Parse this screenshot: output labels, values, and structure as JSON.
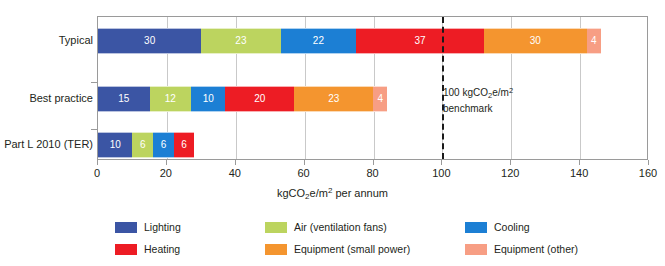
{
  "chart_data": {
    "type": "bar",
    "orientation": "horizontal",
    "stacked": true,
    "title": "",
    "xlabel": "kgCO2e/m2 per annum",
    "ylabel": "",
    "xlim": [
      0,
      160
    ],
    "xticks": [
      0,
      20,
      40,
      60,
      80,
      100,
      120,
      140,
      160
    ],
    "xtick_labels": [
      "0",
      "20",
      "40",
      "60",
      "80",
      "100",
      "120",
      "140",
      "160"
    ],
    "grid": true,
    "legend_position": "bottom",
    "categories": [
      "Typical",
      "Best practice",
      "Part L 2010 (TER)"
    ],
    "series": [
      {
        "name": "Lighting",
        "color": "#3b55a4",
        "values": [
          30,
          15,
          10
        ]
      },
      {
        "name": "Air (ventilation fans)",
        "color": "#bcd45f",
        "values": [
          23,
          12,
          6
        ]
      },
      {
        "name": "Cooling",
        "color": "#1c7fd4",
        "values": [
          22,
          10,
          6
        ]
      },
      {
        "name": "Heating",
        "color": "#ed1c24",
        "values": [
          37,
          20,
          6
        ]
      },
      {
        "name": "Equipment (small power)",
        "color": "#f4952f",
        "values": [
          30,
          23,
          0
        ]
      },
      {
        "name": "Equipment (other)",
        "color": "#f79e84",
        "values": [
          4,
          4,
          0
        ]
      }
    ],
    "totals": [
      146,
      84,
      28
    ],
    "annotations": [
      {
        "name": "benchmark",
        "value": 100,
        "line_1": "100 kgCO2e/m2",
        "line_2": "benchmark",
        "style": "dashed-vertical",
        "color": "#1a1a1a"
      }
    ]
  },
  "axis": {
    "x_title_prefix": "kgCO",
    "x_title_sub": "2",
    "x_title_mid": "e/m",
    "x_title_sup": "2",
    "x_title_suffix": " per annum",
    "ticks": [
      "0",
      "20",
      "40",
      "60",
      "80",
      "100",
      "120",
      "140",
      "160"
    ]
  },
  "rows": [
    {
      "label": "Typical",
      "segments": [
        {
          "label": "30",
          "value": 30
        },
        {
          "label": "23",
          "value": 23
        },
        {
          "label": "22",
          "value": 22
        },
        {
          "label": "37",
          "value": 37
        },
        {
          "label": "30",
          "value": 30
        },
        {
          "label": "4",
          "value": 4
        }
      ]
    },
    {
      "label": "Best practice",
      "segments": [
        {
          "label": "15",
          "value": 15
        },
        {
          "label": "12",
          "value": 12
        },
        {
          "label": "10",
          "value": 10
        },
        {
          "label": "20",
          "value": 20
        },
        {
          "label": "23",
          "value": 23
        },
        {
          "label": "4",
          "value": 4
        }
      ]
    },
    {
      "label": "Part L 2010 (TER)",
      "segments": [
        {
          "label": "10",
          "value": 10
        },
        {
          "label": "6",
          "value": 6
        },
        {
          "label": "6",
          "value": 6
        },
        {
          "label": "6",
          "value": 6
        }
      ]
    }
  ],
  "benchmark": {
    "line_1_prefix": "100 kgCO",
    "line_1_sub": "2",
    "line_1_mid": "e/m",
    "line_1_sup": "2",
    "line_2": "benchmark"
  },
  "legend": {
    "items": [
      {
        "label": "Lighting",
        "color": "#3b55a4"
      },
      {
        "label": "Air (ventilation fans)",
        "color": "#bcd45f"
      },
      {
        "label": "Cooling",
        "color": "#1c7fd4"
      },
      {
        "label": "Heating",
        "color": "#ed1c24"
      },
      {
        "label": "Equipment (small power)",
        "color": "#f4952f"
      },
      {
        "label": "Equipment (other)",
        "color": "#f79e84"
      }
    ],
    "order": [
      0,
      1,
      2,
      3,
      4,
      5
    ]
  },
  "colors": {
    "axis": "#9a9a9a",
    "grid": "#c9c9c9",
    "text": "#231f20",
    "benchmark": "#1a1a1a",
    "background": "#ffffff"
  }
}
